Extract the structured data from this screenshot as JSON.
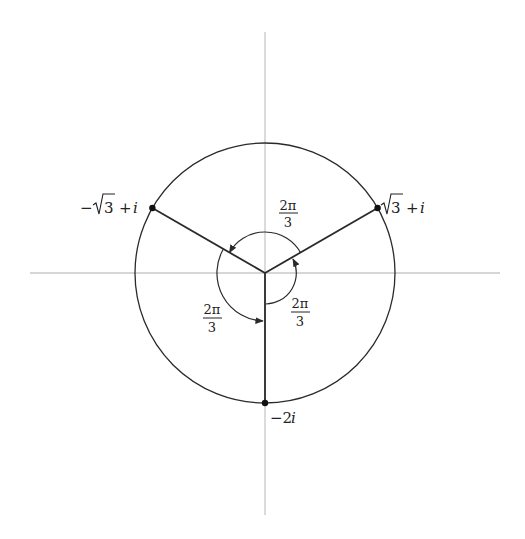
{
  "diagram": {
    "type": "complex-plane-roots",
    "colors": {
      "axis": "#c8c8c8",
      "curve": "#2a2a2a",
      "text": "#222222",
      "background": "#ffffff"
    },
    "points": [
      {
        "id": "p1",
        "label_main": "√3",
        "label_tail": "+ i",
        "angle_deg": 30
      },
      {
        "id": "p2",
        "label_main": "−√3",
        "label_tail": "+ i",
        "angle_deg": 150
      },
      {
        "id": "p3",
        "label_main": "−2",
        "label_tail": "i",
        "angle_deg": 270
      }
    ],
    "angles": [
      {
        "id": "top",
        "numerator": "2π",
        "denominator": "3"
      },
      {
        "id": "left",
        "numerator": "2π",
        "denominator": "3"
      },
      {
        "id": "right",
        "numerator": "2π",
        "denominator": "3"
      }
    ]
  }
}
